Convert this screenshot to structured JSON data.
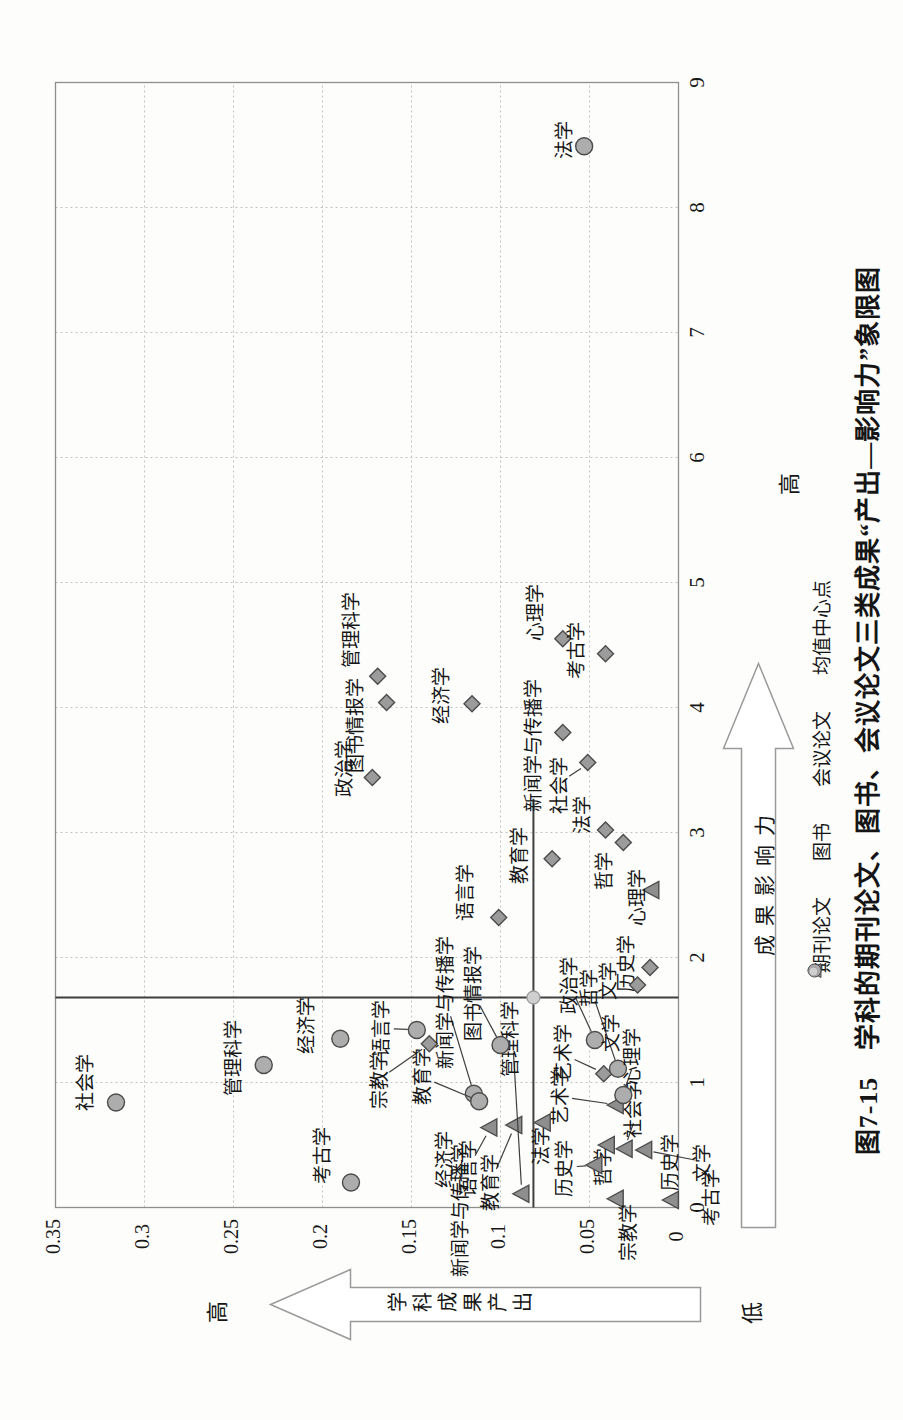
{
  "figure": {
    "title": "图7-15　学科的期刊论文、图书、会议论文三类成果“产出—影响力”象限图"
  },
  "axes": {
    "x": {
      "label": "成果影响力",
      "high": "高"
    },
    "y": {
      "label": "学科成果产出",
      "high": "高",
      "low": "低"
    }
  },
  "legend": {
    "items": [
      {
        "label": "期刊论文",
        "shape": "diamond"
      },
      {
        "label": "图书",
        "shape": "triangle"
      },
      {
        "label": "会议论文",
        "shape": "circle"
      },
      {
        "label": "均值中心点",
        "shape": "dot"
      }
    ]
  },
  "chart_data": {
    "type": "scatter",
    "xlabel": "成果影响力",
    "ylabel": "学科成果产出",
    "xlim": [
      0,
      9
    ],
    "ylim": [
      0,
      0.35
    ],
    "x_ticks": [
      0,
      1,
      2,
      3,
      4,
      5,
      6,
      7,
      8,
      9
    ],
    "y_ticks": [
      0,
      0.05,
      0.1,
      0.15,
      0.2,
      0.25,
      0.3,
      0.35
    ],
    "grid": true,
    "legend_position": "bottom",
    "mean_center": {
      "label": "均值中心点",
      "x": 1.68,
      "y": 0.0815
    },
    "quadrant_lines": {
      "v_x": 1.68,
      "h_y": 0.0815,
      "h_extent_x": [
        0,
        3.27
      ]
    },
    "series": [
      {
        "name": "期刊论文",
        "shape": "diamond",
        "points": [
          {
            "label": "管理科学",
            "x": 4.25,
            "y": 0.169,
            "lx": 46,
            "ly": -24
          },
          {
            "label": "图书情报学",
            "x": 4.04,
            "y": 0.164,
            "lx": -23,
            "ly": -29
          },
          {
            "label": "政治学",
            "x": 3.44,
            "y": 0.172,
            "lx": 9,
            "ly": -26
          },
          {
            "label": "经济学",
            "x": 4.03,
            "y": 0.116,
            "lx": 8,
            "ly": -28
          },
          {
            "label": "心理学",
            "x": 4.55,
            "y": 0.065,
            "lx": 26,
            "ly": -25
          },
          {
            "label": "考古学",
            "x": 4.43,
            "y": 0.041,
            "lx": 3,
            "ly": -27
          },
          {
            "label": "新闻学与传播学",
            "x": 3.8,
            "y": 0.065,
            "lx": -13,
            "ly": -27
          },
          {
            "label": "社会学",
            "x": 3.56,
            "y": 0.051,
            "lx": -23,
            "ly": -26,
            "conn": true
          },
          {
            "label": "法学",
            "x": 3.02,
            "y": 0.041,
            "lx": 15,
            "ly": -21
          },
          {
            "label": "哲学",
            "x": 2.92,
            "y": 0.031,
            "lx": -28,
            "ly": -17
          },
          {
            "label": "教育学",
            "x": 2.79,
            "y": 0.071,
            "lx": 3,
            "ly": -30
          },
          {
            "label": "语言学",
            "x": 2.32,
            "y": 0.101,
            "lx": 25,
            "ly": -31
          },
          {
            "label": "宗教学",
            "x": 1.31,
            "y": 0.14,
            "lx": -37,
            "ly": -48,
            "conn": true
          },
          {
            "label": "历史学",
            "x": 1.92,
            "y": 0.016,
            "lx": 4,
            "ly": -21
          },
          {
            "label": "文学",
            "x": 1.78,
            "y": 0.023,
            "lx": 4,
            "ly": -27
          },
          {
            "label": "艺术学",
            "x": 1.07,
            "y": 0.042,
            "lx": 21,
            "ly": -38,
            "conn": true
          }
        ]
      },
      {
        "name": "图书",
        "shape": "triangle",
        "points": [
          {
            "label": "心理学",
            "x": 2.54,
            "y": 0.015,
            "lx": -7,
            "ly": -12
          },
          {
            "label": "语言学",
            "x": 0.64,
            "y": 0.106,
            "lx": -41,
            "ly": -19,
            "conn": true
          },
          {
            "label": "教育学",
            "x": 0.66,
            "y": 0.092,
            "lx": -57,
            "ly": -22,
            "conn": true
          },
          {
            "label": "法学",
            "x": 0.68,
            "y": 0.076,
            "lx": -23,
            "ly": 0
          },
          {
            "label": "管理科学",
            "x": 0.11,
            "y": 0.088,
            "lx": 155,
            "ly": -9,
            "conn": true
          },
          {
            "label": "哲学",
            "x": 0.5,
            "y": 0.04,
            "lx": -22,
            "ly": -2
          },
          {
            "label": "社会学",
            "x": 0.47,
            "y": 0.03,
            "lx": 39,
            "ly": 11,
            "conn": true
          },
          {
            "label": "文学",
            "x": 0.46,
            "y": 0.019,
            "lx": -13,
            "ly": 60,
            "conn": true
          },
          {
            "label": "历史学",
            "x": 0.34,
            "y": 0.047,
            "lx": -3,
            "ly": -28,
            "conn": true
          },
          {
            "label": "宗教学",
            "x": 0.07,
            "y": 0.035,
            "lx": -34,
            "ly": 14
          },
          {
            "label": "考古学",
            "x": 0.06,
            "y": 0.004,
            "lx": 3,
            "ly": 42
          },
          {
            "label": "艺术学",
            "x": 0.82,
            "y": 0.035,
            "lx": 9,
            "ly": -54,
            "conn": true
          }
        ]
      },
      {
        "name": "会议论文",
        "shape": "circle",
        "points": [
          {
            "label": "法学",
            "x": 8.49,
            "y": 0.053,
            "lx": 6,
            "ly": -18
          },
          {
            "label": "社会学",
            "x": 0.84,
            "y": 0.316,
            "lx": 20,
            "ly": -28
          },
          {
            "label": "管理科学",
            "x": 1.14,
            "y": 0.233,
            "lx": 7,
            "ly": -28
          },
          {
            "label": "经济学",
            "x": 1.35,
            "y": 0.19,
            "lx": 13,
            "ly": -32
          },
          {
            "label": "考古学",
            "x": 0.2,
            "y": 0.184,
            "lx": 27,
            "ly": -26
          },
          {
            "label": "语言学",
            "x": 1.42,
            "y": 0.147,
            "lx": 2,
            "ly": -33,
            "conn": true
          },
          {
            "label": "图书情报学",
            "x": 1.3,
            "y": 0.1,
            "lx": 52,
            "ly": -25,
            "conn": true
          },
          {
            "label": "新闻学与传播学",
            "x": 0.91,
            "y": 0.115,
            "lx": 91,
            "ly": -26,
            "conn": true
          },
          {
            "label": "教育学",
            "x": 0.85,
            "y": 0.112,
            "lx": 25,
            "ly": -54,
            "conn": true
          },
          {
            "label": "政治学",
            "x": 1.34,
            "y": 0.047,
            "lx": 55,
            "ly": -23,
            "conn": true
          },
          {
            "label": "哲学",
            "x": 1.11,
            "y": 0.034,
            "lx": 81,
            "ly": -26,
            "conn": true
          },
          {
            "label": "心理学",
            "x": 0.9,
            "y": 0.031,
            "lx": 39,
            "ly": 11,
            "conn": true
          }
        ]
      }
    ],
    "extra_labels": [
      {
        "label": "文学",
        "px": 388,
        "py": 613
      },
      {
        "label": "历史学",
        "px": 258,
        "py": 672
      },
      {
        "label": "新闻学与传播学",
        "px": 210,
        "py": 462
      },
      {
        "label": "经济学",
        "px": 261,
        "py": 446
      }
    ],
    "colors": {
      "grid": "#c2c2c2",
      "border": "#8f8f8f",
      "quadrant": "#3f3f3f",
      "diamond_fill": "#9b9b9b",
      "triangle_fill": "#8e8e8e",
      "circle_fill": "#adadad",
      "marker_stroke": "#4c4c4c",
      "mean_fill": "#cfcfcf",
      "mean_stroke": "#9a9a9a",
      "arrow_stroke": "#9a9a9a",
      "text": "#161616"
    }
  }
}
